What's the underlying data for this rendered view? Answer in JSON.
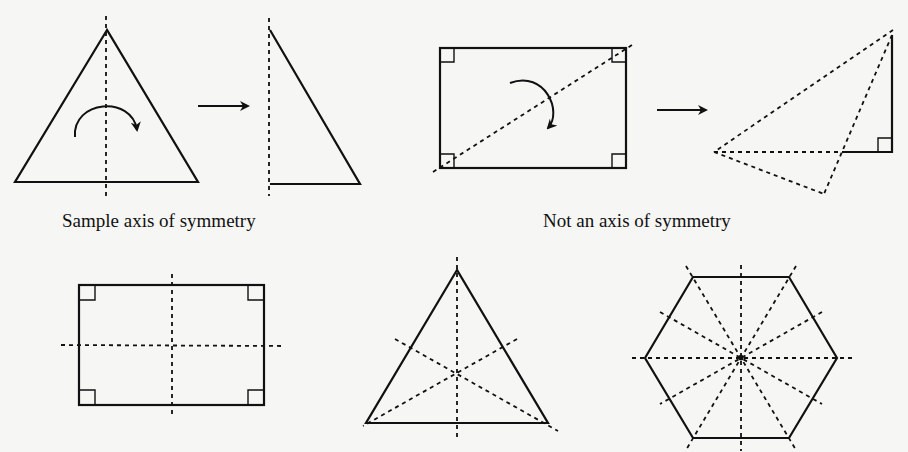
{
  "figure": {
    "captions": {
      "symmetric": "Sample axis of symmetry",
      "not_symmetric": "Not an axis of symmetry"
    },
    "panels": [
      {
        "id": "isosceles-triangle-fold",
        "shape": "triangle",
        "axis": "vertical",
        "is_axis_of_symmetry": true
      },
      {
        "id": "rectangle-diagonal-fold",
        "shape": "rectangle",
        "axis": "diagonal",
        "is_axis_of_symmetry": false
      },
      {
        "id": "rectangle-axes",
        "shape": "rectangle",
        "axes_of_symmetry": 2
      },
      {
        "id": "equilateral-triangle-axes",
        "shape": "equilateral triangle",
        "axes_of_symmetry": 3
      },
      {
        "id": "regular-hexagon-axes",
        "shape": "regular hexagon",
        "axes_of_symmetry": 6
      }
    ]
  }
}
